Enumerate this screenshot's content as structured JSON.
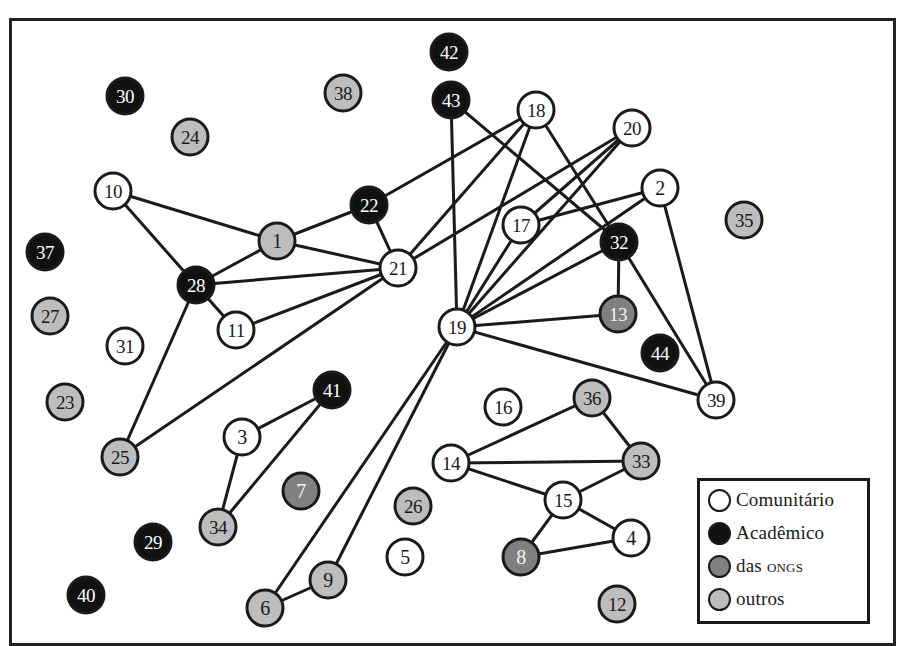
{
  "legend": {
    "items": [
      {
        "key": "comunitario",
        "label": "Comunitário",
        "fill": "#ffffff"
      },
      {
        "key": "academico",
        "label": "Acadêmico",
        "fill": "#111111"
      },
      {
        "key": "ongs",
        "label": "das ONGs",
        "fill": "#808080"
      },
      {
        "key": "outros",
        "label": "outros",
        "fill": "#bdbdbd"
      }
    ]
  },
  "styles": {
    "comunitario": {
      "fill": "#ffffff",
      "text": "#1a1a1a"
    },
    "academico": {
      "fill": "#111111",
      "text": "#ffffff"
    },
    "ongs": {
      "fill": "#808080",
      "text": "#f2f2f2"
    },
    "outros": {
      "fill": "#bdbdbd",
      "text": "#1a1a1a"
    },
    "stroke": "#1a1a1a",
    "edge": "#1a1a1a"
  },
  "nodes": [
    {
      "id": "1",
      "x": 277,
      "y": 241,
      "type": "outros"
    },
    {
      "id": "2",
      "x": 660,
      "y": 188,
      "type": "comunitario"
    },
    {
      "id": "3",
      "x": 242,
      "y": 437,
      "type": "comunitario"
    },
    {
      "id": "4",
      "x": 631,
      "y": 538,
      "type": "comunitario"
    },
    {
      "id": "5",
      "x": 405,
      "y": 557,
      "type": "comunitario"
    },
    {
      "id": "6",
      "x": 265,
      "y": 608,
      "type": "outros"
    },
    {
      "id": "7",
      "x": 301,
      "y": 491,
      "type": "ongs"
    },
    {
      "id": "8",
      "x": 521,
      "y": 557,
      "type": "ongs"
    },
    {
      "id": "9",
      "x": 328,
      "y": 580,
      "type": "outros"
    },
    {
      "id": "10",
      "x": 113,
      "y": 191,
      "type": "comunitario"
    },
    {
      "id": "11",
      "x": 236,
      "y": 330,
      "type": "comunitario"
    },
    {
      "id": "12",
      "x": 617,
      "y": 604,
      "type": "outros"
    },
    {
      "id": "13",
      "x": 618,
      "y": 314,
      "type": "ongs"
    },
    {
      "id": "14",
      "x": 451,
      "y": 463,
      "type": "comunitario"
    },
    {
      "id": "15",
      "x": 563,
      "y": 500,
      "type": "comunitario"
    },
    {
      "id": "16",
      "x": 503,
      "y": 407,
      "type": "comunitario"
    },
    {
      "id": "17",
      "x": 521,
      "y": 225,
      "type": "comunitario"
    },
    {
      "id": "18",
      "x": 536,
      "y": 110,
      "type": "comunitario"
    },
    {
      "id": "19",
      "x": 457,
      "y": 327,
      "type": "comunitario"
    },
    {
      "id": "20",
      "x": 632,
      "y": 128,
      "type": "comunitario"
    },
    {
      "id": "21",
      "x": 398,
      "y": 268,
      "type": "comunitario"
    },
    {
      "id": "22",
      "x": 369,
      "y": 205,
      "type": "academico"
    },
    {
      "id": "23",
      "x": 65,
      "y": 402,
      "type": "outros"
    },
    {
      "id": "24",
      "x": 190,
      "y": 137,
      "type": "outros"
    },
    {
      "id": "25",
      "x": 120,
      "y": 457,
      "type": "outros"
    },
    {
      "id": "26",
      "x": 413,
      "y": 506,
      "type": "outros"
    },
    {
      "id": "27",
      "x": 50,
      "y": 316,
      "type": "outros"
    },
    {
      "id": "28",
      "x": 196,
      "y": 285,
      "type": "academico"
    },
    {
      "id": "29",
      "x": 153,
      "y": 542,
      "type": "academico"
    },
    {
      "id": "30",
      "x": 125,
      "y": 96,
      "type": "academico"
    },
    {
      "id": "31",
      "x": 125,
      "y": 346,
      "type": "comunitario"
    },
    {
      "id": "32",
      "x": 619,
      "y": 242,
      "type": "academico"
    },
    {
      "id": "33",
      "x": 641,
      "y": 461,
      "type": "outros"
    },
    {
      "id": "34",
      "x": 218,
      "y": 527,
      "type": "outros"
    },
    {
      "id": "35",
      "x": 744,
      "y": 220,
      "type": "outros"
    },
    {
      "id": "36",
      "x": 592,
      "y": 398,
      "type": "outros"
    },
    {
      "id": "37",
      "x": 45,
      "y": 252,
      "type": "academico"
    },
    {
      "id": "38",
      "x": 343,
      "y": 93,
      "type": "outros"
    },
    {
      "id": "39",
      "x": 716,
      "y": 400,
      "type": "comunitario"
    },
    {
      "id": "40",
      "x": 86,
      "y": 595,
      "type": "academico"
    },
    {
      "id": "41",
      "x": 332,
      "y": 390,
      "type": "academico"
    },
    {
      "id": "42",
      "x": 449,
      "y": 52,
      "type": "academico"
    },
    {
      "id": "43",
      "x": 451,
      "y": 100,
      "type": "academico"
    },
    {
      "id": "44",
      "x": 660,
      "y": 353,
      "type": "academico"
    }
  ],
  "edges": [
    [
      "10",
      "1"
    ],
    [
      "10",
      "28"
    ],
    [
      "1",
      "22"
    ],
    [
      "1",
      "21"
    ],
    [
      "1",
      "28"
    ],
    [
      "28",
      "21"
    ],
    [
      "28",
      "11"
    ],
    [
      "28",
      "25"
    ],
    [
      "11",
      "21"
    ],
    [
      "25",
      "21"
    ],
    [
      "22",
      "21"
    ],
    [
      "22",
      "18"
    ],
    [
      "21",
      "18"
    ],
    [
      "21",
      "20"
    ],
    [
      "43",
      "19"
    ],
    [
      "43",
      "32"
    ],
    [
      "18",
      "19"
    ],
    [
      "18",
      "32"
    ],
    [
      "20",
      "17"
    ],
    [
      "20",
      "19"
    ],
    [
      "17",
      "19"
    ],
    [
      "17",
      "2"
    ],
    [
      "2",
      "19"
    ],
    [
      "2",
      "39"
    ],
    [
      "32",
      "19"
    ],
    [
      "32",
      "13"
    ],
    [
      "32",
      "39"
    ],
    [
      "13",
      "19"
    ],
    [
      "19",
      "39"
    ],
    [
      "19",
      "6"
    ],
    [
      "19",
      "9"
    ],
    [
      "6",
      "9"
    ],
    [
      "3",
      "41"
    ],
    [
      "3",
      "34"
    ],
    [
      "34",
      "41"
    ],
    [
      "14",
      "36"
    ],
    [
      "14",
      "33"
    ],
    [
      "14",
      "15"
    ],
    [
      "36",
      "33"
    ],
    [
      "33",
      "15"
    ],
    [
      "15",
      "8"
    ],
    [
      "15",
      "4"
    ],
    [
      "8",
      "4"
    ]
  ]
}
